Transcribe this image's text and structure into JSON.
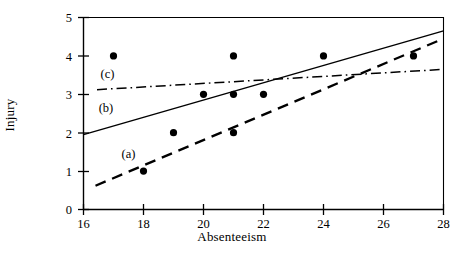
{
  "chart_data": {
    "type": "scatter",
    "title": "",
    "xlabel": "Absenteeism",
    "ylabel": "Injury",
    "xlim": [
      16,
      28
    ],
    "ylim": [
      0,
      5
    ],
    "xticks": [
      16,
      18,
      20,
      22,
      24,
      26,
      28
    ],
    "yticks": [
      0,
      1,
      2,
      3,
      4,
      5
    ],
    "grid": false,
    "legend_position": "inline-annotations",
    "points": {
      "name": "Observations",
      "marker": "filled-circle",
      "x": [
        17,
        18,
        19,
        20,
        21,
        21,
        21,
        22,
        24,
        27
      ],
      "y": [
        4,
        1,
        2,
        3,
        4,
        3,
        2,
        3,
        4,
        4
      ]
    },
    "series": [
      {
        "name": "(a)",
        "label": "(a)",
        "style": "dashed",
        "x_endpoints": [
          16.4,
          28
        ],
        "y_endpoints": [
          0.62,
          4.45
        ]
      },
      {
        "name": "(b)",
        "label": "(b)",
        "style": "solid",
        "x_endpoints": [
          16,
          28
        ],
        "y_endpoints": [
          1.95,
          4.65
        ]
      },
      {
        "name": "(c)",
        "label": "(c)",
        "style": "dash-dot",
        "x_endpoints": [
          16.45,
          28
        ],
        "y_endpoints": [
          3.12,
          3.65
        ]
      }
    ],
    "annotations": [
      {
        "text": "(a)",
        "x": 17.5,
        "y": 1.35
      },
      {
        "text": "(b)",
        "x": 16.75,
        "y": 2.55
      },
      {
        "text": "(c)",
        "x": 16.8,
        "y": 3.42
      }
    ],
    "colors": {
      "axis": "#000000",
      "marker": "#000000",
      "line_a": "#000000",
      "line_b": "#000000",
      "line_c": "#000000",
      "background": "#ffffff"
    }
  },
  "axis_titles": {
    "x": "Absenteeism",
    "y": "Injury"
  },
  "tick_labels": {
    "x": [
      "16",
      "18",
      "20",
      "22",
      "24",
      "26",
      "28"
    ],
    "y": [
      "0",
      "1",
      "2",
      "3",
      "4",
      "5"
    ]
  }
}
